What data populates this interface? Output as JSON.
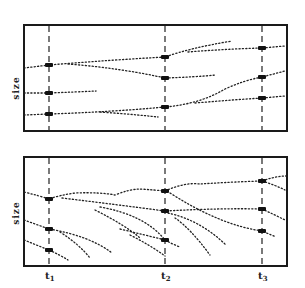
{
  "diagram": {
    "type": "two-panel schematic of size trajectories over time",
    "time_markers": [
      {
        "label": "t",
        "sub": "1"
      },
      {
        "label": "t",
        "sub": "2"
      },
      {
        "label": "t",
        "sub": "3"
      }
    ],
    "panels": [
      {
        "id": "top",
        "ylabel": "size",
        "markers_at_t1": 3,
        "markers_at_t2": 3,
        "markers_at_t3": 3,
        "description": "Roughly parallel dotted trajectories; ranks largely preserved over time"
      },
      {
        "id": "bottom",
        "ylabel": "size",
        "markers_at_t1": 3,
        "markers_at_t2": 3,
        "markers_at_t3": 3,
        "description": "Dotted trajectories descending and crossing; individuals drop out with new ones entering from above"
      }
    ],
    "colors": {
      "ink": "#222222",
      "background": "#ffffff"
    }
  }
}
